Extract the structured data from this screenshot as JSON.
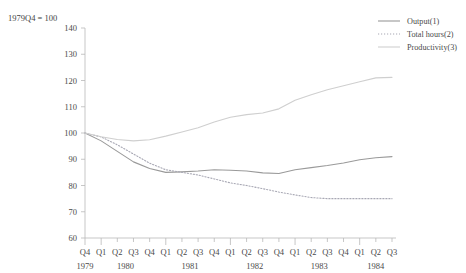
{
  "axis": {
    "unit_label": "1979Q4 = 100",
    "y_ticks": [
      140,
      130,
      120,
      110,
      100,
      90,
      80,
      70,
      60
    ],
    "quarter_labels": [
      "Q4",
      "Q1",
      "Q2",
      "Q3",
      "Q4",
      "Q1",
      "Q2",
      "Q3",
      "Q4",
      "Q1",
      "Q2",
      "Q3",
      "Q4",
      "Q1",
      "Q2",
      "Q3",
      "Q4",
      "Q1",
      "Q2",
      "Q3"
    ],
    "year_labels": [
      "1979",
      "1980",
      "1981",
      "1982",
      "1983",
      "1984"
    ]
  },
  "legend": {
    "items": [
      {
        "label": "Output(1)",
        "style": "solid",
        "color": "#9a9a9a"
      },
      {
        "label": "Total hours(2)",
        "style": "dotted",
        "color": "#a8a8b4"
      },
      {
        "label": "Productivity(3)",
        "style": "solid",
        "color": "#cfcfcf"
      }
    ]
  },
  "chart_data": {
    "type": "line",
    "title": "",
    "subtitle": "",
    "xlabel": "",
    "ylabel": "1979Q4 = 100",
    "ylim": [
      60,
      140
    ],
    "grid": false,
    "legend_position": "top-right",
    "x": [
      "1979Q4",
      "1980Q1",
      "1980Q2",
      "1980Q3",
      "1980Q4",
      "1981Q1",
      "1981Q2",
      "1981Q3",
      "1981Q4",
      "1982Q1",
      "1982Q2",
      "1982Q3",
      "1982Q4",
      "1983Q1",
      "1983Q2",
      "1983Q3",
      "1983Q4",
      "1984Q1",
      "1984Q2",
      "1984Q3"
    ],
    "series": [
      {
        "name": "Output(1)",
        "style": "solid",
        "color": "#9a9a9a",
        "values": [
          100.0,
          97.0,
          93.0,
          89.0,
          86.5,
          85.0,
          85.2,
          85.5,
          86.0,
          85.8,
          85.5,
          84.8,
          84.6,
          86.0,
          86.8,
          87.6,
          88.6,
          89.8,
          90.6,
          91.0
        ]
      },
      {
        "name": "Total hours(2)",
        "style": "dotted",
        "color": "#a8a8b4",
        "values": [
          100.0,
          98.5,
          95.5,
          92.0,
          88.5,
          86.0,
          85.0,
          84.0,
          82.5,
          81.0,
          80.0,
          78.8,
          77.5,
          76.4,
          75.4,
          75.0,
          75.0,
          75.0,
          75.0,
          75.0
        ]
      },
      {
        "name": "Productivity(3)",
        "style": "solid",
        "color": "#cfcfcf",
        "values": [
          100.0,
          98.6,
          97.5,
          97.0,
          97.4,
          98.8,
          100.4,
          102.0,
          104.2,
          106.0,
          107.0,
          107.6,
          109.2,
          112.5,
          114.6,
          116.5,
          118.0,
          119.5,
          121.0,
          121.2
        ]
      }
    ]
  }
}
